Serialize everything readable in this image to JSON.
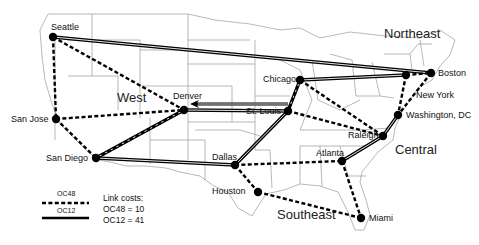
{
  "regions": [
    {
      "name": "West",
      "x": 117,
      "y": 90
    },
    {
      "name": "Northeast",
      "x": 384,
      "y": 26
    },
    {
      "name": "Central",
      "x": 395,
      "y": 142
    },
    {
      "name": "Southeast",
      "x": 277,
      "y": 207
    }
  ],
  "nodes": [
    {
      "id": "seattle",
      "label": "Seattle",
      "x": 53,
      "y": 37,
      "lx": 51,
      "ly": 22
    },
    {
      "id": "sanjose",
      "label": "San Jose",
      "x": 56,
      "y": 119,
      "lx": 11,
      "ly": 114
    },
    {
      "id": "sandiego",
      "label": "San Diego",
      "x": 96,
      "y": 158,
      "lx": 46,
      "ly": 153
    },
    {
      "id": "denver",
      "label": "Denver",
      "x": 184,
      "y": 110,
      "lx": 173,
      "ly": 91
    },
    {
      "id": "chicago",
      "label": "Chicago",
      "x": 300,
      "y": 80,
      "lx": 263,
      "ly": 74
    },
    {
      "id": "stlouis",
      "label": "St. Louis",
      "x": 288,
      "y": 111,
      "lx": 246,
      "ly": 106
    },
    {
      "id": "dallas",
      "label": "Dallas",
      "x": 235,
      "y": 165,
      "lx": 212,
      "ly": 152
    },
    {
      "id": "houston",
      "label": "Houston",
      "x": 258,
      "y": 192,
      "lx": 212,
      "ly": 186
    },
    {
      "id": "miami",
      "label": "Miami",
      "x": 361,
      "y": 218,
      "lx": 369,
      "ly": 213
    },
    {
      "id": "atlanta",
      "label": "Atlanta",
      "x": 342,
      "y": 161,
      "lx": 316,
      "ly": 148
    },
    {
      "id": "raleigh",
      "label": "Raleigh",
      "x": 383,
      "y": 136,
      "lx": 348,
      "ly": 130
    },
    {
      "id": "washington",
      "label": "Washington, DC",
      "x": 398,
      "y": 115,
      "lx": 406,
      "ly": 110
    },
    {
      "id": "newyork",
      "label": "New York",
      "x": 406,
      "y": 75,
      "lx": 416,
      "ly": 90
    },
    {
      "id": "boston",
      "label": "Boston",
      "x": 431,
      "y": 73,
      "lx": 438,
      "ly": 68
    }
  ],
  "links_oc12": [
    {
      "from": "seattle",
      "to": "boston"
    },
    {
      "from": "chicago",
      "to": "newyork"
    },
    {
      "from": "stlouis",
      "to": "denver"
    },
    {
      "from": "sandiego",
      "to": "dallas"
    },
    {
      "from": "sandiego",
      "to": "denver"
    },
    {
      "from": "dallas",
      "to": "stlouis"
    },
    {
      "from": "stlouis",
      "to": "chicago"
    },
    {
      "from": "washington",
      "to": "raleigh"
    },
    {
      "from": "raleigh",
      "to": "atlanta"
    }
  ],
  "links_oc48": [
    {
      "from": "seattle",
      "to": "sanjose"
    },
    {
      "from": "seattle",
      "to": "denver"
    },
    {
      "from": "sanjose",
      "to": "denver"
    },
    {
      "from": "sanjose",
      "to": "sandiego"
    },
    {
      "from": "sandiego",
      "to": "denver"
    },
    {
      "from": "chicago",
      "to": "stlouis"
    },
    {
      "from": "chicago",
      "to": "raleigh"
    },
    {
      "from": "stlouis",
      "to": "raleigh"
    },
    {
      "from": "dallas",
      "to": "atlanta"
    },
    {
      "from": "dallas",
      "to": "houston"
    },
    {
      "from": "houston",
      "to": "miami"
    },
    {
      "from": "atlanta",
      "to": "miami"
    },
    {
      "from": "newyork",
      "to": "washington"
    },
    {
      "from": "newyork",
      "to": "boston"
    },
    {
      "from": "boston",
      "to": "washington"
    }
  ],
  "arrow_denver": {
    "from_x": 288,
    "from_y": 104,
    "to_x": 190,
    "to_y": 104
  },
  "legend": {
    "oc48_label": "OC48",
    "oc12_label": "OC12",
    "costs_title": "Link costs:",
    "oc48_cost": "OC48 = 10",
    "oc12_cost": "OC12 = 41"
  },
  "colors": {
    "node": "#000000",
    "link": "#000000",
    "map_lines": "#9a9a9a"
  }
}
